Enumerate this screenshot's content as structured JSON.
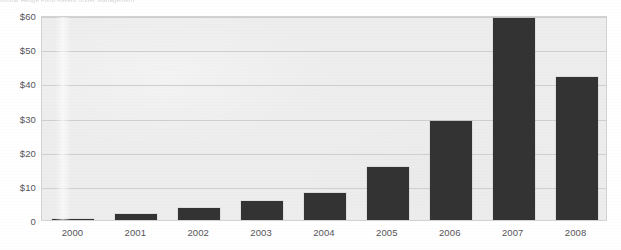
{
  "title_artifact": {
    "text": "Global Hedge Fund Assets Under Management",
    "legible": false
  },
  "chart_data": {
    "type": "bar",
    "title": "",
    "xlabel": "",
    "ylabel": "",
    "categories": [
      "2000",
      "2001",
      "2002",
      "2003",
      "2004",
      "2005",
      "2006",
      "2007",
      "2008"
    ],
    "values": [
      0.3,
      1.8,
      3.5,
      5.5,
      8,
      15.5,
      29,
      59,
      42
    ],
    "ylim": [
      0,
      60
    ],
    "ytick_values": [
      0,
      10,
      20,
      30,
      40,
      50,
      60
    ],
    "ytick_labels": [
      "0",
      "$10",
      "$20",
      "$30",
      "$40",
      "$50",
      "$60"
    ],
    "grid": true,
    "grid_axis": "y",
    "legend": false,
    "legend_position": "none",
    "bar_color": "#333333",
    "plot_background": "#ededed",
    "page_background": "#ffffff",
    "gridline_color": "#cfcfcf",
    "axis_label_color": "#55555a"
  }
}
